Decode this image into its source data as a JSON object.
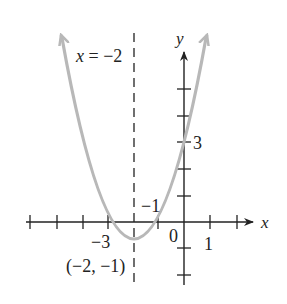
{
  "diagram": {
    "type": "parabola-graph",
    "equation": "y = (x + 2)^2 - 1",
    "axes": {
      "x_label": "x",
      "y_label": "y",
      "x_ticks": [
        -6,
        -5,
        -4,
        -3,
        -2,
        -1,
        0,
        1,
        2
      ],
      "y_ticks": [
        -2,
        -1,
        1,
        2,
        3,
        4,
        5
      ]
    },
    "labels": {
      "axis_of_symmetry": "x = −2",
      "vertex": "(−2, −1)",
      "x_intercept_left": "−3",
      "x_intercept_right": "−1",
      "y_intercept": "3",
      "origin": "0",
      "x_one": "1"
    },
    "colors": {
      "curve": "#b8b8b8",
      "axes": "#222222"
    }
  }
}
